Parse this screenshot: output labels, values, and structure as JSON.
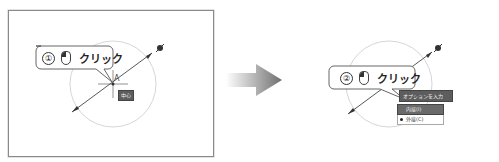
{
  "steps": [
    {
      "number": "①",
      "action": "クリック",
      "mouse_button": "left",
      "center_label": "中心",
      "point_label": "A"
    },
    {
      "number": "②",
      "action": "クリック",
      "mouse_button": "left",
      "menu": {
        "title": "オプションを入力",
        "items": [
          {
            "label": "内接(I)",
            "selected": true
          },
          {
            "label": "外接(C)",
            "selected": false,
            "bullet": true
          }
        ]
      }
    }
  ],
  "colors": {
    "frame_border": "#8a8a8a",
    "circle": "#d0d0d0",
    "line": "#444444",
    "label_bg": "#5d5d5d",
    "arrow_dark": "#7a7a7a"
  },
  "icons": {
    "mouse": "mouse-left-click-icon",
    "cursor": "pencil-cursor-icon",
    "arrow": "next-step-arrow-icon"
  }
}
